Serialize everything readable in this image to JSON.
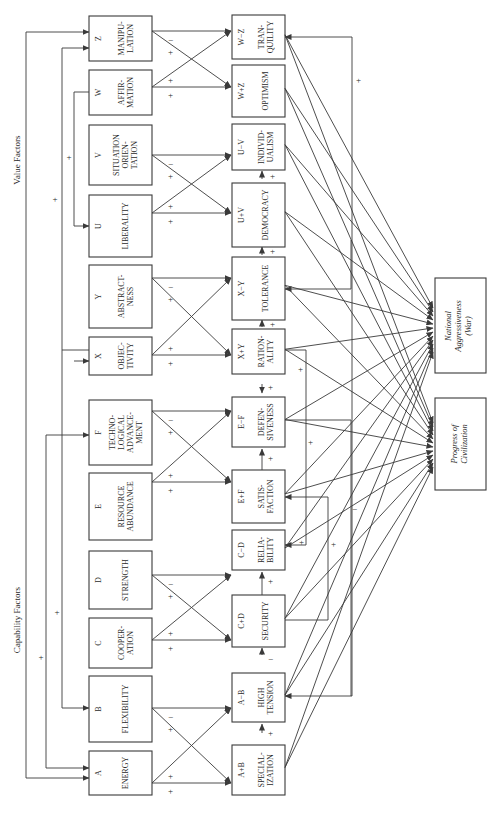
{
  "headings": {
    "value_factors": "Value Factors",
    "capability_factors": "Capability Factors"
  },
  "inputs": [
    {
      "letter": "Z",
      "lines": [
        "MANIPU-",
        "LATION"
      ]
    },
    {
      "letter": "W",
      "lines": [
        "AFFIR-",
        "MATION"
      ]
    },
    {
      "letter": "V",
      "lines": [
        "SITUATION",
        "ORIEN-",
        "TATION"
      ]
    },
    {
      "letter": "U",
      "lines": [
        "LIBERALITY"
      ]
    },
    {
      "letter": "Y",
      "lines": [
        "ABSTRACT-",
        "NESS"
      ]
    },
    {
      "letter": "X",
      "lines": [
        "OBJEC-",
        "TIVITY"
      ]
    },
    {
      "letter": "F",
      "lines": [
        "TECHNO-",
        "LOGICAL",
        "ADVANCE-",
        "MENT"
      ]
    },
    {
      "letter": "E",
      "lines": [
        "RESOURCE",
        "ABUNDANCE"
      ]
    },
    {
      "letter": "D",
      "lines": [
        "STRENGTH"
      ]
    },
    {
      "letter": "C",
      "lines": [
        "COOPER-",
        "ATION"
      ]
    },
    {
      "letter": "B",
      "lines": [
        "FLEXIBILITY"
      ]
    },
    {
      "letter": "A",
      "lines": [
        "ENERGY"
      ]
    }
  ],
  "outputs": [
    {
      "formula": "W−Z",
      "lines": [
        "TRAN-",
        "QUILITY"
      ]
    },
    {
      "formula": "W+Z",
      "lines": [
        "OPTIMISM"
      ]
    },
    {
      "formula": "U−V",
      "lines": [
        "INDIVID-",
        "UALISM"
      ]
    },
    {
      "formula": "U+V",
      "lines": [
        "DEMOCRACY"
      ]
    },
    {
      "formula": "X−Y",
      "lines": [
        "TOLERANCE"
      ]
    },
    {
      "formula": "X+Y",
      "lines": [
        "RATION-",
        "ALITY"
      ]
    },
    {
      "formula": "E−F",
      "lines": [
        "DEFEN-",
        "SIVENESS"
      ]
    },
    {
      "formula": "E+F",
      "lines": [
        "SATIS-",
        "FACTION"
      ]
    },
    {
      "formula": "C−D",
      "lines": [
        "RELIA-",
        "BILITY"
      ]
    },
    {
      "formula": "C+D",
      "lines": [
        "SECURITY"
      ]
    },
    {
      "formula": "A−B",
      "lines": [
        "HIGH",
        "TENSION"
      ]
    },
    {
      "formula": "A+B",
      "lines": [
        "SPECIAL-",
        "IZATION"
      ]
    }
  ],
  "targets": {
    "war": [
      "National",
      "Aggressiveness",
      "(War)"
    ],
    "progress": [
      "Progress of",
      "Civilization"
    ]
  },
  "signs": {
    "plus": "+",
    "minus": "−"
  }
}
